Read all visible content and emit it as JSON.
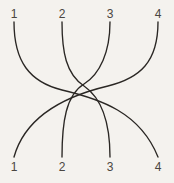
{
  "figure": {
    "name": "braid-diagram",
    "width": 174,
    "height": 183,
    "background_color": "#f4f2ee",
    "stroke_color": "#2a2724",
    "label_color": "#4a4641"
  },
  "labels": {
    "top": [
      {
        "text": "1",
        "x": 14
      },
      {
        "text": "2",
        "x": 62
      },
      {
        "text": "3",
        "x": 110
      },
      {
        "text": "4",
        "x": 158
      }
    ],
    "bottom": [
      {
        "text": "1",
        "x": 14
      },
      {
        "text": "2",
        "x": 62
      },
      {
        "text": "3",
        "x": 110
      },
      {
        "text": "4",
        "x": 158
      }
    ]
  },
  "chart_data": {
    "type": "line",
    "title": "",
    "xlabel": "",
    "ylabel": "",
    "grid": false,
    "legend": "none",
    "x": [
      14,
      62,
      110,
      158
    ],
    "xlim": [
      0,
      174
    ],
    "ylim": [
      183,
      0
    ],
    "positions": {
      "top_y": 22,
      "bottom_y": 157,
      "columns": [
        14,
        62,
        110,
        158
      ]
    },
    "series": [
      {
        "name": "strand-1-to-4",
        "from_top": "1",
        "to_bottom": "4",
        "path": "M 14 22 C 14 62, 30 82, 62 90 C 100 99, 140 112, 158 157"
      },
      {
        "name": "strand-2-to-3",
        "from_top": "2",
        "to_bottom": "3",
        "path": "M 62 22 C 62 52, 66 74, 84 86 C 100 97, 110 118, 110 157"
      },
      {
        "name": "strand-3-to-2",
        "from_top": "3",
        "to_bottom": "2",
        "path": "M 110 22 C 110 52, 100 74, 84 84 C 66 95, 62 122, 62 157"
      },
      {
        "name": "strand-4-to-1",
        "from_top": "4",
        "to_bottom": "1",
        "path": "M 158 22 C 158 62, 140 78, 108 86 C 70 95, 26 114, 14 157"
      }
    ]
  }
}
